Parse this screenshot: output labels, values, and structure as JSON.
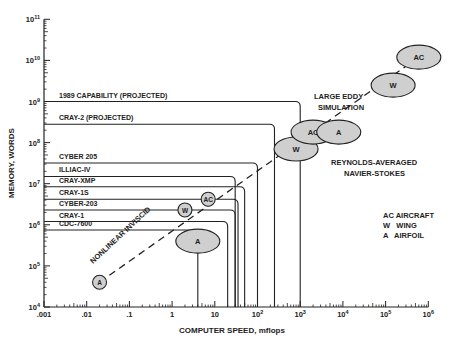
{
  "chart_data": {
    "type": "scatter",
    "title": "",
    "xlabel": "COMPUTER SPEED, mflops",
    "ylabel": "MEMORY, WORDS",
    "xscale": "log",
    "yscale": "log",
    "xlim": [
      0.001,
      1000000
    ],
    "ylim": [
      10000,
      100000000000
    ],
    "x_ticks": [
      ".001",
      ".01",
      ".1",
      "1",
      "10",
      "10^2",
      "10^3",
      "10^4",
      "10^5",
      "10^6"
    ],
    "y_ticks": [
      "10^4",
      "10^5",
      "10^6",
      "10^7",
      "10^8",
      "10^9",
      "10^10",
      "10^11"
    ],
    "grid": false,
    "computers": [
      {
        "name": "1989 CAPABILITY (PROJECTED)",
        "memory_words": 1000000000,
        "speed_mflops": 1000
      },
      {
        "name": "CRAY-2 (PROJECTED)",
        "memory_words": 280000000,
        "speed_mflops": 250
      },
      {
        "name": "CYBER 205",
        "memory_words": 32000000,
        "speed_mflops": 100
      },
      {
        "name": "ILLIAC-IV",
        "memory_words": 15000000,
        "speed_mflops": 30
      },
      {
        "name": "CRAY-XMP",
        "memory_words": 8400000,
        "speed_mflops": 50
      },
      {
        "name": "CRAY-1S",
        "memory_words": 4200000,
        "speed_mflops": 35
      },
      {
        "name": "CYBER-203",
        "memory_words": 2300000,
        "speed_mflops": 30
      },
      {
        "name": "CRAY-1",
        "memory_words": 1200000,
        "speed_mflops": 20
      },
      {
        "name": "CDC-7600",
        "memory_words": 750000,
        "speed_mflops": 4
      }
    ],
    "requirements": [
      {
        "method": "NONLINEAR INVISCID",
        "label": "A",
        "speed_mflops": 0.02,
        "memory_words": 40000,
        "size": "small"
      },
      {
        "method": "NONLINEAR INVISCID",
        "label": "W",
        "speed_mflops": 2,
        "memory_words": 2300000,
        "size": "small"
      },
      {
        "method": "NONLINEAR INVISCID",
        "label": "AC",
        "speed_mflops": 7,
        "memory_words": 4200000,
        "size": "small"
      },
      {
        "method": "NONLINEAR INVISCID",
        "label": "A",
        "speed_mflops": 4,
        "memory_words": 400000,
        "size": "large"
      },
      {
        "method": "REYNOLDS-AVERAGED NAVIER-STOKES",
        "label": "W",
        "speed_mflops": 800,
        "memory_words": 70000000,
        "size": "large"
      },
      {
        "method": "REYNOLDS-AVERAGED NAVIER-STOKES",
        "label": "AC",
        "speed_mflops": 2000,
        "memory_words": 180000000,
        "size": "large"
      },
      {
        "method": "LARGE EDDY SIMULATION",
        "label": "A",
        "speed_mflops": 8000,
        "memory_words": 180000000,
        "size": "large"
      },
      {
        "method": "LARGE EDDY SIMULATION",
        "label": "W",
        "speed_mflops": 150000,
        "memory_words": 2500000000,
        "size": "large"
      },
      {
        "method": "LARGE EDDY SIMULATION",
        "label": "AC",
        "speed_mflops": 600000,
        "memory_words": 12000000000,
        "size": "large"
      }
    ],
    "annotations": [
      "NONLINEAR INVISCID",
      "LARGE EDDY SIMULATION",
      "REYNOLDS-AVERAGED NAVIER-STOKES"
    ],
    "legend": [
      {
        "key": "AC",
        "label": "AIRCRAFT"
      },
      {
        "key": "W",
        "label": "WING"
      },
      {
        "key": "A",
        "label": "AIRFOIL"
      }
    ]
  },
  "labels": {
    "xlabel": "COMPUTER SPEED, mflops",
    "ylabel": "MEMORY, WORDS",
    "les_1": "LARGE EDDY",
    "les_2": "SIMULATION",
    "rans_1": "REYNOLDS-AVERAGED",
    "rans_2": "NAVIER-STOKES",
    "inviscid": "NONLINEAR INVISCID",
    "legend_ac": "AC AIRCRAFT",
    "legend_w": "W   WING",
    "legend_a": "A   AIRFOIL"
  },
  "style": {
    "line_color": "#222222",
    "ellipse_fill": "#cfcfcf"
  }
}
